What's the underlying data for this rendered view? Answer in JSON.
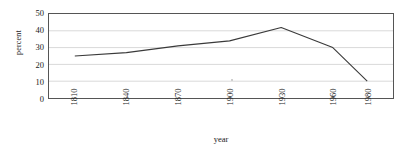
{
  "chart_data": {
    "type": "line",
    "title": "",
    "xlabel": "year",
    "ylabel": "percent",
    "categories": [
      "1810",
      "1840",
      "1870",
      "1900",
      "1930",
      "1960",
      "1980"
    ],
    "x": [
      1810,
      1840,
      1870,
      1900,
      1930,
      1960,
      1980
    ],
    "values": [
      25,
      27,
      31,
      34,
      42,
      30,
      10
    ],
    "series": [
      {
        "name": "percent",
        "values": [
          25,
          27,
          31,
          34,
          42,
          30,
          10
        ],
        "color": "#3a3a3a"
      }
    ],
    "xlim": [
      1795,
      1995
    ],
    "ylim": [
      0,
      50
    ],
    "y_ticks": [
      0,
      10,
      20,
      30,
      40,
      50
    ],
    "x_ticks": [
      1810,
      1840,
      1870,
      1900,
      1930,
      1960,
      1980
    ],
    "grid": "horizontal",
    "gridline_color": "#d9d9d9",
    "legend": "none",
    "legend_position": "none",
    "plot_border_color": "#555555",
    "background_color": "#ffffff"
  },
  "axes": {
    "y_title": "percent",
    "x_title": "year",
    "y_tick_labels": [
      "50",
      "40",
      "30",
      "20",
      "10",
      "0"
    ],
    "x_tick_labels": [
      "1810",
      "1840",
      "1870",
      "1900",
      "1930",
      "1960",
      "1980"
    ]
  }
}
